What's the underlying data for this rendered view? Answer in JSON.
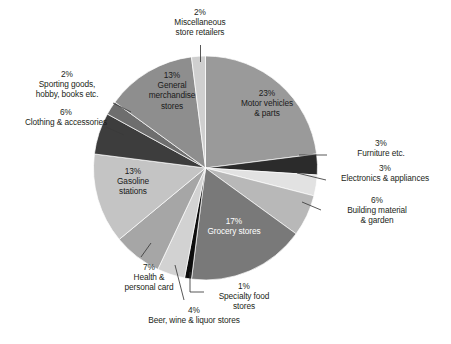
{
  "chart_data": {
    "type": "pie",
    "title": "",
    "subtitle": "",
    "xlabel": "",
    "ylabel": "",
    "legend_position": "none",
    "grid": false,
    "value_unit": "%",
    "start_angle_deg": 0,
    "direction": "clockwise",
    "total": 100,
    "categories": [
      "Motor vehicles & parts",
      "Furniture etc.",
      "Electronics & appliances",
      "Building material & garden",
      "Grocery stores",
      "Specialty food stores",
      "Beer, wine & liquor stores",
      "Health & personal card",
      "Gasoline stations",
      "Clothing & accessories",
      "Sporting goods, hobby, books etc.",
      "General merchandise stores",
      "Miscellaneous store retailers"
    ],
    "values": [
      23,
      3,
      3,
      6,
      17,
      1,
      4,
      7,
      13,
      6,
      2,
      13,
      2
    ],
    "slices": [
      {
        "label": "Motor vehicles & parts",
        "percent": 23,
        "percent_text": "23%",
        "color": "#9a9a9a",
        "label_placement": "inside",
        "label_color": "#1a1a1a"
      },
      {
        "label": "Furniture etc.",
        "percent": 3,
        "percent_text": "3%",
        "color": "#2b2b2b",
        "label_placement": "outside",
        "label_color": "#231f20"
      },
      {
        "label": "Electronics & appliances",
        "percent": 3,
        "percent_text": "3%",
        "color": "#e2e2e2",
        "label_placement": "outside",
        "label_color": "#231f20"
      },
      {
        "label": "Building material & garden",
        "percent": 6,
        "percent_text": "6%",
        "color": "#b8b8b8",
        "label_placement": "outside",
        "label_color": "#231f20"
      },
      {
        "label": "Grocery stores",
        "percent": 17,
        "percent_text": "17%",
        "color": "#797979",
        "label_placement": "inside",
        "label_color": "#ffffff"
      },
      {
        "label": "Specialty food stores",
        "percent": 1,
        "percent_text": "1%",
        "color": "#0d0d0d",
        "label_placement": "outside",
        "label_color": "#231f20"
      },
      {
        "label": "Beer, wine & liquor stores",
        "percent": 4,
        "percent_text": "4%",
        "color": "#d2d2d2",
        "label_placement": "outside",
        "label_color": "#231f20"
      },
      {
        "label": "Health & personal card",
        "percent": 7,
        "percent_text": "7%",
        "color": "#a6a6a6",
        "label_placement": "outside",
        "label_color": "#231f20"
      },
      {
        "label": "Gasoline stations",
        "percent": 13,
        "percent_text": "13%",
        "color": "#c4c4c4",
        "label_placement": "inside",
        "label_color": "#1a1a1a"
      },
      {
        "label": "Clothing & accessories",
        "percent": 6,
        "percent_text": "6%",
        "color": "#3d3d3d",
        "label_placement": "outside",
        "label_color": "#231f20"
      },
      {
        "label": "Sporting goods, hobby, books etc.",
        "percent": 2,
        "percent_text": "2%",
        "color": "#6e6e6e",
        "label_placement": "outside",
        "label_color": "#231f20"
      },
      {
        "label": "General merchandise stores",
        "percent": 13,
        "percent_text": "13%",
        "color": "#8e8e8e",
        "label_placement": "inside",
        "label_color": "#1a1a1a"
      },
      {
        "label": "Miscellaneous store retailers",
        "percent": 2,
        "percent_text": "2%",
        "color": "#cfcfcf",
        "label_placement": "outside",
        "label_color": "#231f20"
      }
    ]
  },
  "labels": {
    "miscellaneous": "2%\nMiscellaneous\nstore retailers",
    "sporting_goods": "2%\nSporting goods,\nhobby, books etc.",
    "clothing": "6%\nClothing & accessories",
    "furniture": "3%\nFurniture etc.",
    "electronics": "3%\nElectronics & appliances",
    "building_material": "6%\nBuilding material\n& garden",
    "specialty_food": "1%\nSpecialty food\nstores",
    "beer_wine": "4%\nBeer, wine & liquor stores",
    "health": "7%\nHealth &\npersonal card",
    "motor_vehicles": "23%\nMotor vehicles\n& parts",
    "general_merchandise": "13%\nGeneral\nmerchandise\nstores",
    "gasoline": "13%\nGasoline\nstations",
    "grocery": "17%\nGrocery stores"
  },
  "leader_line_color": "#3a3a3a"
}
